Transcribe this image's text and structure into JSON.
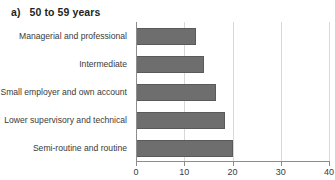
{
  "figure": {
    "label": "a)",
    "title": "50 to 59 years"
  },
  "chart_data": {
    "type": "bar",
    "orientation": "horizontal",
    "title": "a)   50 to 59 years",
    "xlabel": "",
    "ylabel": "",
    "xlim": [
      0,
      40
    ],
    "xticks": [
      0,
      10,
      20,
      30,
      40
    ],
    "xticklabels": [
      "0",
      "10",
      "20",
      "30",
      "40"
    ],
    "grid": "vertical",
    "legend": "none",
    "bar_color": "#6e6e6e",
    "bar_edge_color": "#5a5a5a",
    "categories": [
      "Managerial and professional",
      "Intermediate",
      "Small employer and own account",
      "Lower supervisory and technical",
      "Semi-routine and routine"
    ],
    "values": [
      12.5,
      14.0,
      16.5,
      18.5,
      20.0
    ]
  }
}
